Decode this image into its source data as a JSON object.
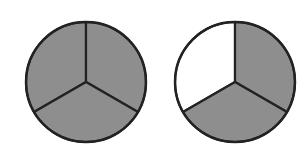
{
  "figure": {
    "colors": {
      "shaded": "#8e8e8e",
      "unshaded": "#ffffff",
      "stroke": "#222222",
      "background": "#ffffff"
    },
    "circles": [
      {
        "name": "left-circle",
        "cx": 86,
        "cy": 82,
        "r": 60,
        "parts": 3,
        "shaded_parts": 3,
        "sectors": [
          {
            "position": "upper-left",
            "shaded": true
          },
          {
            "position": "upper-right",
            "shaded": true
          },
          {
            "position": "bottom",
            "shaded": true
          }
        ]
      },
      {
        "name": "right-circle",
        "cx": 235,
        "cy": 82,
        "r": 60,
        "parts": 3,
        "shaded_parts": 2,
        "sectors": [
          {
            "position": "upper-left",
            "shaded": false
          },
          {
            "position": "upper-right",
            "shaded": true
          },
          {
            "position": "bottom",
            "shaded": true
          }
        ]
      }
    ]
  }
}
